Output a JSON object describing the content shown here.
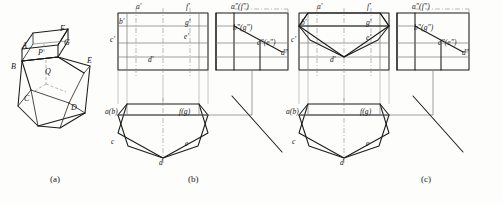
{
  "figure": {
    "captions": [
      {
        "key": "a",
        "label": "(a)",
        "x": 50,
        "y": 177
      },
      {
        "key": "b",
        "label": "(b)",
        "x": 188,
        "y": 177
      },
      {
        "key": "c",
        "label": "(c)",
        "x": 421,
        "y": 177
      }
    ],
    "footnote": "",
    "colors": {
      "ink": "#1a1a1a",
      "thin": "#6d6d6d",
      "construction": "#9a9a9a",
      "center": "#7a7a7a",
      "paper": "#fdfdfc"
    }
  },
  "pictorial": {
    "name": "isometric-view",
    "vertex_labels": [
      {
        "text": "F",
        "x": 60,
        "y": 27
      },
      {
        "text": "G",
        "x": 64,
        "y": 41
      },
      {
        "text": "A",
        "x": 14,
        "y": 44
      },
      {
        "text": "P",
        "x": 35,
        "y": 51
      },
      {
        "text": "B",
        "x": 6,
        "y": 66
      },
      {
        "text": "E",
        "x": 86,
        "y": 58
      },
      {
        "text": "Q",
        "x": 44,
        "y": 70
      },
      {
        "text": "C",
        "x": 23,
        "y": 98
      },
      {
        "text": "D",
        "x": 70,
        "y": 106
      }
    ]
  },
  "views": {
    "b": {
      "name": "projection-set-b",
      "front_view_labels": [
        {
          "text": "a'",
          "x": 137,
          "y": 5
        },
        {
          "text": "f'",
          "x": 185,
          "y": 5
        },
        {
          "text": "b'",
          "x": 117,
          "y": 20
        },
        {
          "text": "g'",
          "x": 184,
          "y": 21
        },
        {
          "text": "c'",
          "x": 113,
          "y": 38
        },
        {
          "text": "e'",
          "x": 183,
          "y": 34
        },
        {
          "text": "d'",
          "x": 148,
          "y": 58
        }
      ],
      "side_view_labels": [
        {
          "text": "a\"(f\")",
          "x": 232,
          "y": 5
        },
        {
          "text": "b\"(g\")",
          "x": 232,
          "y": 26
        },
        {
          "text": "c\"(e\")",
          "x": 257,
          "y": 41
        },
        {
          "text": "d\"",
          "x": 281,
          "y": 51
        }
      ],
      "top_view_labels": [
        {
          "text": "a(b)",
          "x": 110,
          "y": 110
        },
        {
          "text": "f(g)",
          "x": 177,
          "y": 110
        },
        {
          "text": "c",
          "x": 112,
          "y": 140
        },
        {
          "text": "e",
          "x": 183,
          "y": 142
        },
        {
          "text": "d",
          "x": 146,
          "y": 166
        }
      ]
    },
    "c": {
      "name": "projection-set-c",
      "front_view_labels": [
        {
          "text": "a'",
          "x": 318,
          "y": 5
        },
        {
          "text": "f'",
          "x": 366,
          "y": 5
        },
        {
          "text": "b'",
          "x": 299,
          "y": 21
        },
        {
          "text": "g'",
          "x": 365,
          "y": 21
        },
        {
          "text": "c'",
          "x": 294,
          "y": 38
        },
        {
          "text": "e'",
          "x": 365,
          "y": 36
        },
        {
          "text": "d'",
          "x": 329,
          "y": 58
        }
      ],
      "side_view_labels": [
        {
          "text": "a\"(f\")",
          "x": 413,
          "y": 5
        },
        {
          "text": "b\"(g\")",
          "x": 413,
          "y": 26
        },
        {
          "text": "c\"(e\")",
          "x": 438,
          "y": 41
        },
        {
          "text": "d\"",
          "x": 462,
          "y": 51
        }
      ],
      "top_view_labels": [
        {
          "text": "a(b)",
          "x": 291,
          "y": 110
        },
        {
          "text": "f(g)",
          "x": 358,
          "y": 110
        },
        {
          "text": "c",
          "x": 293,
          "y": 140
        },
        {
          "text": "e",
          "x": 364,
          "y": 142
        },
        {
          "text": "d",
          "x": 327,
          "y": 166
        }
      ]
    }
  }
}
